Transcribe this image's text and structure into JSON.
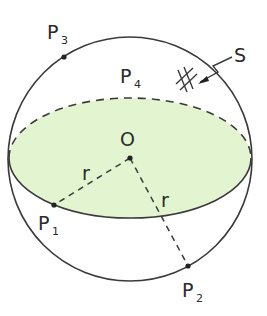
{
  "figure": {
    "colors": {
      "equator_fill": "#e3f5d0",
      "line": "#3a3a3a",
      "background": "#ffffff"
    },
    "center": {
      "label": "O"
    },
    "radius_labels": [
      "r",
      "r"
    ],
    "points": [
      {
        "label": "P",
        "sub": "1"
      },
      {
        "label": "P",
        "sub": "2"
      },
      {
        "label": "P",
        "sub": "3"
      },
      {
        "label": "P",
        "sub": "4"
      }
    ],
    "surface": {
      "label": "S"
    }
  }
}
